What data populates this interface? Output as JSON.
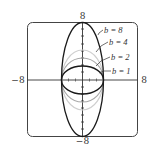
{
  "figure": {
    "type": "graph",
    "window": {
      "xmin": -8,
      "xmax": 8,
      "ymin": -8,
      "ymax": 8
    },
    "axis_labels": {
      "x_min": "−8",
      "x_max": "8",
      "y_min": "−8",
      "y_max": "8"
    },
    "curves": [
      {
        "label": "b = 8",
        "b": 8,
        "color": "#1a1a1a",
        "ry_px": 57
      },
      {
        "label": "b = 4",
        "b": 4,
        "color": "#c8c8c8",
        "ry_px": 30
      },
      {
        "label": "b = 2",
        "b": 2,
        "color": "#9a9a9a",
        "ry_px": 22
      },
      {
        "label": "b = 1",
        "b": 1,
        "color": "#1a1a1a",
        "ry_px": 14
      }
    ]
  }
}
